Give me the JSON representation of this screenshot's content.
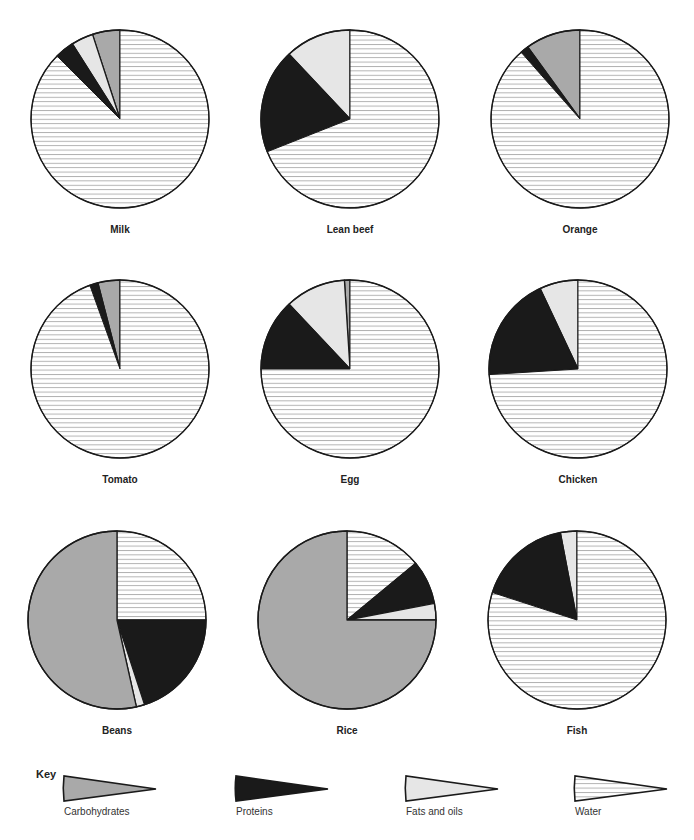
{
  "chart_data": {
    "type": "pie",
    "title": "",
    "categories": [
      "Carbohydrates",
      "Proteins",
      "Fats and oils",
      "Water"
    ],
    "colors": {
      "Carbohydrates": "#a9a9a9",
      "Proteins": "#1a1a1a",
      "Fats and oils": "#e6e6e6",
      "Water": "#ffffff",
      "water_hatch": "#8a8a8a",
      "outline": "#1a1a1a"
    },
    "charts": [
      {
        "name": "Milk",
        "direction": "counterclockwise-from-top",
        "slices": [
          {
            "category": "Carbohydrates",
            "value": 5
          },
          {
            "category": "Fats and oils",
            "value": 4
          },
          {
            "category": "Proteins",
            "value": 3.5
          },
          {
            "category": "Water",
            "value": 87.5
          }
        ]
      },
      {
        "name": "Lean beef",
        "direction": "counterclockwise-from-top",
        "slices": [
          {
            "category": "Fats and oils",
            "value": 12
          },
          {
            "category": "Proteins",
            "value": 19
          },
          {
            "category": "Water",
            "value": 69
          }
        ]
      },
      {
        "name": "Orange",
        "direction": "counterclockwise-from-top",
        "slices": [
          {
            "category": "Carbohydrates",
            "value": 10
          },
          {
            "category": "Proteins",
            "value": 1.5
          },
          {
            "category": "Water",
            "value": 88.5
          }
        ]
      },
      {
        "name": "Tomato",
        "direction": "counterclockwise-from-top",
        "slices": [
          {
            "category": "Carbohydrates",
            "value": 4
          },
          {
            "category": "Proteins",
            "value": 1.5
          },
          {
            "category": "Water",
            "value": 94.5
          }
        ]
      },
      {
        "name": "Egg",
        "direction": "counterclockwise-from-top",
        "slices": [
          {
            "category": "Carbohydrates",
            "value": 1
          },
          {
            "category": "Fats and oils",
            "value": 11
          },
          {
            "category": "Proteins",
            "value": 13
          },
          {
            "category": "Water",
            "value": 75
          }
        ]
      },
      {
        "name": "Chicken",
        "direction": "counterclockwise-from-top",
        "slices": [
          {
            "category": "Fats and oils",
            "value": 7
          },
          {
            "category": "Proteins",
            "value": 19
          },
          {
            "category": "Water",
            "value": 74
          }
        ]
      },
      {
        "name": "Beans",
        "direction": "clockwise-from-top",
        "slices": [
          {
            "category": "Water",
            "value": 25
          },
          {
            "category": "Proteins",
            "value": 20
          },
          {
            "category": "Fats and oils",
            "value": 1.5
          },
          {
            "category": "Carbohydrates",
            "value": 53.5
          }
        ]
      },
      {
        "name": "Rice",
        "direction": "clockwise-from-top",
        "slices": [
          {
            "category": "Water",
            "value": 14
          },
          {
            "category": "Proteins",
            "value": 8
          },
          {
            "category": "Fats and oils",
            "value": 3
          },
          {
            "category": "Carbohydrates",
            "value": 75
          }
        ]
      },
      {
        "name": "Fish",
        "direction": "counterclockwise-from-top",
        "slices": [
          {
            "category": "Fats and oils",
            "value": 3
          },
          {
            "category": "Proteins",
            "value": 17
          },
          {
            "category": "Water",
            "value": 80
          }
        ]
      }
    ],
    "legend": {
      "title": "Key",
      "placement": "bottom",
      "entries": [
        "Carbohydrates",
        "Proteins",
        "Fats and oils",
        "Water"
      ]
    }
  }
}
